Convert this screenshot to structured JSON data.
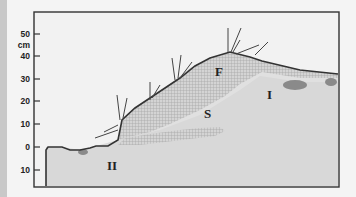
{
  "diagram": {
    "type": "soil cross-section",
    "axis": {
      "unit": "cm",
      "ticks": [
        {
          "label": "50",
          "y": 34
        },
        {
          "label": "40",
          "y": 56
        },
        {
          "label": "30",
          "y": 79
        },
        {
          "label": "20",
          "y": 101
        },
        {
          "label": "10",
          "y": 124
        },
        {
          "label": "0",
          "y": 147
        },
        {
          "label": "10",
          "y": 170
        }
      ]
    },
    "regions": {
      "F": "F",
      "S": "S",
      "I": "I",
      "II": "II"
    },
    "colors": {
      "background": "#f4f4f4",
      "soil": "#d8d8d8",
      "hatch": "#b0b0b0",
      "dark_patch": "#8a8a8a",
      "frame": "#333333"
    }
  }
}
